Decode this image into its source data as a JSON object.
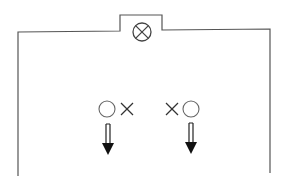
{
  "diagram": {
    "colors": {
      "line": "#555555",
      "symbol": "#444444",
      "arrow": "#111111",
      "background": "#ffffff"
    },
    "elements": {
      "lamp": {
        "symbol": "circle-with-cross",
        "label": ""
      },
      "left_marker": {
        "items": [
          "circle",
          "cross"
        ],
        "label": ""
      },
      "right_marker": {
        "items": [
          "cross",
          "circle"
        ],
        "label": ""
      },
      "left_arrow": {
        "direction": "down",
        "style": "double-shaft"
      },
      "right_arrow": {
        "direction": "down",
        "style": "double-shaft"
      }
    }
  }
}
